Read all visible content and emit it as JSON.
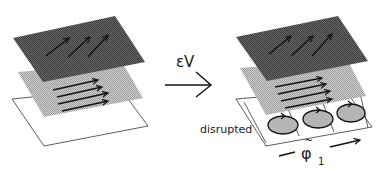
{
  "figure": {
    "transform_label": "εV",
    "disrupted_label": "disrupted",
    "phi_label": "φ",
    "phi_tilde": "~",
    "phi_subscript": "1"
  },
  "colors": {
    "dark_layer": "#555555",
    "light_layer": "#bdbdbd",
    "bottom_layer": "#ffffff",
    "stroke": "#1a1a1a",
    "cell_fill": "#b0b0b0"
  },
  "panels": [
    {
      "name": "before",
      "layers": [
        "dark layer with diagonal flow arrows",
        "light layer with horizontal flow arrows",
        "white bottom layer"
      ]
    },
    {
      "name": "after",
      "layers": [
        "dark layer with diagonal flow arrows",
        "light layer with horizontal flow arrows",
        "bottom layer split into 3 cells with circulating flows"
      ]
    }
  ]
}
